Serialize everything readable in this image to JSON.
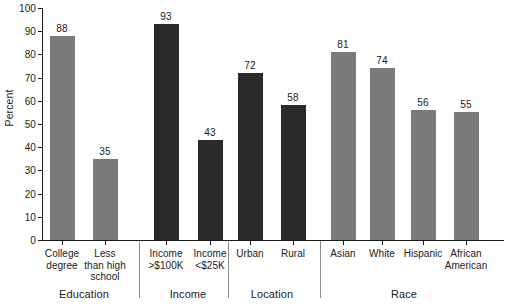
{
  "chart_data": {
    "type": "bar",
    "title": "",
    "xlabel": "",
    "ylabel": "Percent",
    "ylim": [
      0,
      100
    ],
    "ytick_step": 10,
    "yticks": [
      0,
      10,
      20,
      30,
      40,
      50,
      60,
      70,
      80,
      90,
      100
    ],
    "ytick_labels": [
      "0",
      "10",
      "20",
      "30",
      "40",
      "50",
      "60",
      "70",
      "80",
      "90",
      "100"
    ],
    "grid": false,
    "legend": "none",
    "categories": [
      "College degree",
      "Less than high school",
      "Income >$100K",
      "Income <$25K",
      "Urban",
      "Rural",
      "Asian",
      "White",
      "Hispanic",
      "African American"
    ],
    "values": [
      88,
      35,
      93,
      43,
      72,
      58,
      81,
      74,
      56,
      55
    ],
    "value_labels": [
      "88",
      "35",
      "93",
      "43",
      "72",
      "58",
      "81",
      "74",
      "56",
      "55"
    ],
    "groups": [
      {
        "name": "Education",
        "categories": [
          "College degree",
          "Less than high school"
        ],
        "color": "#7a7a7a"
      },
      {
        "name": "Income",
        "categories": [
          "Income >$100K",
          "Income <$25K"
        ],
        "color": "#2b2b2b"
      },
      {
        "name": "Location",
        "categories": [
          "Urban",
          "Rural"
        ],
        "color": "#2b2b2b"
      },
      {
        "name": "Race",
        "categories": [
          "Asian",
          "White",
          "Hispanic",
          "African American"
        ],
        "color": "#7a7a7a"
      }
    ]
  },
  "axes": {
    "y_title": "Percent",
    "y_tick_labels": [
      "100",
      "90",
      "80",
      "70",
      "60",
      "50",
      "40",
      "30",
      "20",
      "10",
      "0"
    ]
  },
  "bars": [
    {
      "value_label": "88",
      "color": "#7a7a7a",
      "group": "Education"
    },
    {
      "value_label": "35",
      "color": "#7a7a7a",
      "group": "Education"
    },
    {
      "value_label": "93",
      "color": "#2b2b2b",
      "group": "Income"
    },
    {
      "value_label": "43",
      "color": "#2b2b2b",
      "group": "Income"
    },
    {
      "value_label": "72",
      "color": "#2b2b2b",
      "group": "Location"
    },
    {
      "value_label": "58",
      "color": "#2b2b2b",
      "group": "Location"
    },
    {
      "value_label": "81",
      "color": "#7a7a7a",
      "group": "Race"
    },
    {
      "value_label": "74",
      "color": "#7a7a7a",
      "group": "Race"
    },
    {
      "value_label": "56",
      "color": "#7a7a7a",
      "group": "Race"
    },
    {
      "value_label": "55",
      "color": "#7a7a7a",
      "group": "Race"
    }
  ],
  "category_labels": [
    {
      "line1": "College",
      "line2": "degree",
      "line3": ""
    },
    {
      "line1": "Less",
      "line2": "than high",
      "line3": "school"
    },
    {
      "line1": "Income",
      "line2": ">$100K",
      "line3": ""
    },
    {
      "line1": "Income",
      "line2": "<$25K",
      "line3": ""
    },
    {
      "line1": "Urban",
      "line2": "",
      "line3": ""
    },
    {
      "line1": "Rural",
      "line2": "",
      "line3": ""
    },
    {
      "line1": "Asian",
      "line2": "",
      "line3": ""
    },
    {
      "line1": "White",
      "line2": "",
      "line3": ""
    },
    {
      "line1": "Hispanic",
      "line2": "",
      "line3": ""
    },
    {
      "line1": "African",
      "line2": "American",
      "line3": ""
    }
  ],
  "group_labels": [
    "Education",
    "Income",
    "Location",
    "Race"
  ],
  "colors": {
    "bar_gray": "#7a7a7a",
    "bar_dark": "#2b2b2b",
    "axis": "#1a1a1a",
    "separator": "#8c8c8c",
    "background": "#ffffff"
  }
}
